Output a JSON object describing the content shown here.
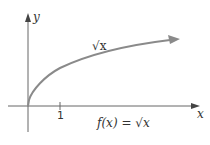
{
  "diagram": {
    "title": "",
    "y_axis_label": "y",
    "x_axis_label": "x",
    "tick_label": "1",
    "curve_label": "√x",
    "caption": "f(x) = √x",
    "colors": {
      "axes": "#555555",
      "curve": "#8a8a8a",
      "text": "#333333"
    }
  }
}
